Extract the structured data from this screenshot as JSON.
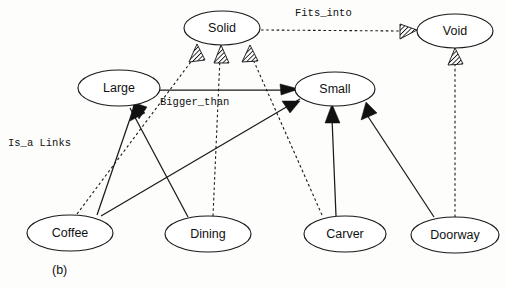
{
  "figure": {
    "caption": "(b)",
    "width": 506,
    "height": 288,
    "background_color": "#fdfdfc",
    "line_color": "#1a1a1a"
  },
  "legend": {
    "is_a_links_label": "Is_a Links",
    "bigger_than_label": "Bigger_than",
    "fits_into_label": "Fits_into"
  },
  "nodes": [
    {
      "id": "solid",
      "label": "Solid",
      "cx": 222,
      "cy": 28,
      "rx": 38,
      "ry": 17
    },
    {
      "id": "void",
      "label": "Void",
      "cx": 455,
      "cy": 31,
      "rx": 38,
      "ry": 17
    },
    {
      "id": "large",
      "label": "Large",
      "cx": 119,
      "cy": 88,
      "rx": 41,
      "ry": 18
    },
    {
      "id": "small",
      "label": "Small",
      "cx": 335,
      "cy": 89,
      "rx": 40,
      "ry": 17
    },
    {
      "id": "coffee",
      "label": "Coffee",
      "cx": 70,
      "cy": 233,
      "rx": 43,
      "ry": 18
    },
    {
      "id": "dining",
      "label": "Dining",
      "cx": 208,
      "cy": 234,
      "rx": 43,
      "ry": 18
    },
    {
      "id": "carver",
      "label": "Carver",
      "cx": 345,
      "cy": 234,
      "rx": 41,
      "ry": 18
    },
    {
      "id": "doorway",
      "label": "Doorway",
      "cx": 455,
      "cy": 235,
      "rx": 44,
      "ry": 18
    }
  ],
  "edges": [
    {
      "id": "coffee-large",
      "from": "Coffee",
      "to": "Large",
      "relation": "Is_a",
      "style": "solid",
      "arrow": "solid"
    },
    {
      "id": "dining-large",
      "from": "Dining",
      "to": "Large",
      "relation": "Is_a",
      "style": "solid",
      "arrow": "solid"
    },
    {
      "id": "carver-small",
      "from": "Carver",
      "to": "Small",
      "relation": "Is_a",
      "style": "solid",
      "arrow": "solid"
    },
    {
      "id": "doorway-small",
      "from": "Doorway",
      "to": "Small",
      "relation": "Is_a",
      "style": "solid",
      "arrow": "solid"
    },
    {
      "id": "dining-small",
      "from": "Dining",
      "to": "Small",
      "relation": "Is_a",
      "style": "solid",
      "arrow": "solid"
    },
    {
      "id": "large-small",
      "from": "Large",
      "to": "Small",
      "relation": "Bigger_than",
      "style": "solid",
      "arrow": "none"
    },
    {
      "id": "coffee-solid",
      "from": "Coffee",
      "to": "Solid",
      "relation": "Is_a",
      "style": "dashed",
      "arrow": "hatch"
    },
    {
      "id": "dining-solid",
      "from": "Dining",
      "to": "Solid",
      "relation": "Is_a",
      "style": "dashed",
      "arrow": "hatch"
    },
    {
      "id": "carver-solid",
      "from": "Carver",
      "to": "Solid",
      "relation": "Is_a",
      "style": "dashed",
      "arrow": "hatch"
    },
    {
      "id": "solid-void",
      "from": "Solid",
      "to": "Void",
      "relation": "Fits_into",
      "style": "dashed",
      "arrow": "hatch"
    },
    {
      "id": "doorway-void",
      "from": "Doorway",
      "to": "Void",
      "relation": "Is_a",
      "style": "dashed",
      "arrow": "hatch"
    }
  ]
}
